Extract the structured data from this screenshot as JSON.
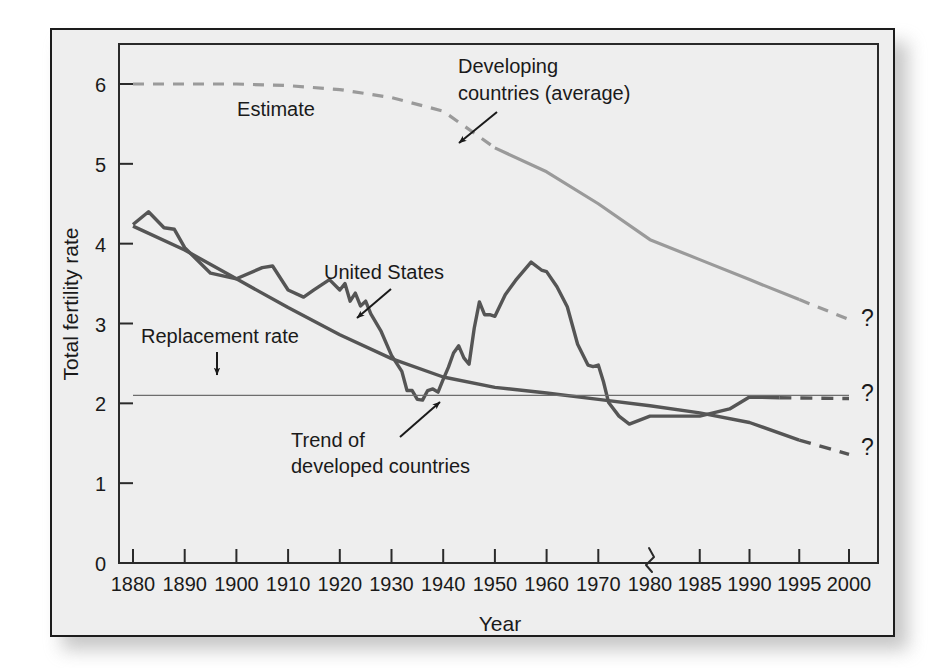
{
  "figure": {
    "background_color": "#eeeeee",
    "frame_color": "#1c1c1c",
    "page_color": "#ffffff"
  },
  "chart_data": {
    "type": "line",
    "title": "",
    "xlabel": "Year",
    "ylabel": "Total fertility rate",
    "ylim": [
      0,
      6.4
    ],
    "yticks": [
      0,
      1,
      2,
      3,
      4,
      5,
      6
    ],
    "ytick_labels": [
      "0",
      "1",
      "2",
      "3",
      "4",
      "5",
      "6"
    ],
    "xticks": [
      1880,
      1890,
      1900,
      1910,
      1920,
      1930,
      1940,
      1950,
      1960,
      1970,
      1980,
      1985,
      1990,
      1995,
      2000
    ],
    "xtick_labels": [
      "1880",
      "1890",
      "1900",
      "1910",
      "1920",
      "1930",
      "1940",
      "1950",
      "1960",
      "1970",
      "1980",
      "1985",
      "1990",
      "1995",
      "2000"
    ],
    "axis_break": {
      "at_year": 1980,
      "note": "x-axis scale changes from 10-year to 5-year spacing after 1980",
      "symbol": "zigzag"
    },
    "grid": false,
    "legend_position": "inline-annotations",
    "series": [
      {
        "name": "Developing countries (average)",
        "color": "#9a9a9a",
        "style_segments": [
          {
            "dash": "dashed",
            "from_year": 1880,
            "to_year": 1950,
            "label": "Estimate"
          },
          {
            "dash": "solid",
            "from_year": 1950,
            "to_year": 1995
          },
          {
            "dash": "dashed",
            "from_year": 1995,
            "to_year": 2000,
            "label": "projection"
          }
        ],
        "points": [
          {
            "x": 1880,
            "y": 6.0
          },
          {
            "x": 1890,
            "y": 6.0
          },
          {
            "x": 1900,
            "y": 6.0
          },
          {
            "x": 1910,
            "y": 5.98
          },
          {
            "x": 1920,
            "y": 5.93
          },
          {
            "x": 1930,
            "y": 5.83
          },
          {
            "x": 1940,
            "y": 5.66
          },
          {
            "x": 1950,
            "y": 5.2
          },
          {
            "x": 1960,
            "y": 4.9
          },
          {
            "x": 1970,
            "y": 4.5
          },
          {
            "x": 1980,
            "y": 4.05
          },
          {
            "x": 1985,
            "y": 3.8
          },
          {
            "x": 1990,
            "y": 3.55
          },
          {
            "x": 1995,
            "y": 3.3
          },
          {
            "x": 2000,
            "y": 3.05
          }
        ]
      },
      {
        "name": "United States",
        "color": "#555555",
        "style_segments": [
          {
            "dash": "solid",
            "from_year": 1880,
            "to_year": 1993
          },
          {
            "dash": "dashed",
            "from_year": 1993,
            "to_year": 2000
          }
        ],
        "points": [
          {
            "x": 1880,
            "y": 4.24
          },
          {
            "x": 1883,
            "y": 4.4
          },
          {
            "x": 1886,
            "y": 4.2
          },
          {
            "x": 1888,
            "y": 4.18
          },
          {
            "x": 1890,
            "y": 3.95
          },
          {
            "x": 1895,
            "y": 3.63
          },
          {
            "x": 1900,
            "y": 3.56
          },
          {
            "x": 1905,
            "y": 3.7
          },
          {
            "x": 1907,
            "y": 3.72
          },
          {
            "x": 1910,
            "y": 3.42
          },
          {
            "x": 1913,
            "y": 3.33
          },
          {
            "x": 1915,
            "y": 3.42
          },
          {
            "x": 1918,
            "y": 3.55
          },
          {
            "x": 1920,
            "y": 3.42
          },
          {
            "x": 1921,
            "y": 3.5
          },
          {
            "x": 1922,
            "y": 3.28
          },
          {
            "x": 1923,
            "y": 3.38
          },
          {
            "x": 1924,
            "y": 3.22
          },
          {
            "x": 1925,
            "y": 3.28
          },
          {
            "x": 1926,
            "y": 3.12
          },
          {
            "x": 1928,
            "y": 2.9
          },
          {
            "x": 1930,
            "y": 2.6
          },
          {
            "x": 1932,
            "y": 2.4
          },
          {
            "x": 1933,
            "y": 2.16
          },
          {
            "x": 1934,
            "y": 2.16
          },
          {
            "x": 1935,
            "y": 2.05
          },
          {
            "x": 1936,
            "y": 2.04
          },
          {
            "x": 1937,
            "y": 2.16
          },
          {
            "x": 1938,
            "y": 2.18
          },
          {
            "x": 1939,
            "y": 2.14
          },
          {
            "x": 1940,
            "y": 2.3
          },
          {
            "x": 1941,
            "y": 2.45
          },
          {
            "x": 1942,
            "y": 2.63
          },
          {
            "x": 1943,
            "y": 2.72
          },
          {
            "x": 1944,
            "y": 2.57
          },
          {
            "x": 1945,
            "y": 2.49
          },
          {
            "x": 1946,
            "y": 2.94
          },
          {
            "x": 1947,
            "y": 3.27
          },
          {
            "x": 1948,
            "y": 3.11
          },
          {
            "x": 1949,
            "y": 3.11
          },
          {
            "x": 1950,
            "y": 3.09
          },
          {
            "x": 1952,
            "y": 3.36
          },
          {
            "x": 1954,
            "y": 3.54
          },
          {
            "x": 1957,
            "y": 3.77
          },
          {
            "x": 1959,
            "y": 3.67
          },
          {
            "x": 1960,
            "y": 3.65
          },
          {
            "x": 1962,
            "y": 3.46
          },
          {
            "x": 1964,
            "y": 3.21
          },
          {
            "x": 1966,
            "y": 2.74
          },
          {
            "x": 1968,
            "y": 2.48
          },
          {
            "x": 1969,
            "y": 2.46
          },
          {
            "x": 1970,
            "y": 2.48
          },
          {
            "x": 1971,
            "y": 2.27
          },
          {
            "x": 1972,
            "y": 2.01
          },
          {
            "x": 1974,
            "y": 1.84
          },
          {
            "x": 1976,
            "y": 1.74
          },
          {
            "x": 1980,
            "y": 1.84
          },
          {
            "x": 1985,
            "y": 1.84
          },
          {
            "x": 1988,
            "y": 1.93
          },
          {
            "x": 1990,
            "y": 2.08
          },
          {
            "x": 1993,
            "y": 2.07
          },
          {
            "x": 2000,
            "y": 2.06
          }
        ]
      },
      {
        "name": "Trend of developed countries",
        "color": "#555555",
        "style_segments": [
          {
            "dash": "solid",
            "from_year": 1880,
            "to_year": 1995
          },
          {
            "dash": "dashed",
            "from_year": 1995,
            "to_year": 2000
          }
        ],
        "points": [
          {
            "x": 1880,
            "y": 4.22
          },
          {
            "x": 1890,
            "y": 3.92
          },
          {
            "x": 1900,
            "y": 3.56
          },
          {
            "x": 1910,
            "y": 3.2
          },
          {
            "x": 1920,
            "y": 2.86
          },
          {
            "x": 1930,
            "y": 2.56
          },
          {
            "x": 1940,
            "y": 2.33
          },
          {
            "x": 1950,
            "y": 2.2
          },
          {
            "x": 1960,
            "y": 2.13
          },
          {
            "x": 1970,
            "y": 2.05
          },
          {
            "x": 1980,
            "y": 1.97
          },
          {
            "x": 1985,
            "y": 1.88
          },
          {
            "x": 1990,
            "y": 1.76
          },
          {
            "x": 1995,
            "y": 1.54
          },
          {
            "x": 2000,
            "y": 1.36
          }
        ]
      },
      {
        "name": "Replacement rate",
        "color": "#6d6d6d",
        "style_segments": [
          {
            "dash": "solid",
            "from_year": 1880,
            "to_year": 2000
          }
        ],
        "constant_value": 2.1,
        "points": [
          {
            "x": 1880,
            "y": 2.1
          },
          {
            "x": 2000,
            "y": 2.1
          }
        ]
      }
    ],
    "annotations": [
      {
        "id": "estimate",
        "text": "Estimate",
        "x_px": 276,
        "y_px": 116,
        "arrow": false
      },
      {
        "id": "developing-countries",
        "text_line_1": "Developing",
        "text_line_2": "countries (average)",
        "x_px": 458,
        "y_px": 73,
        "arrow": true
      },
      {
        "id": "united-states",
        "text": "United States",
        "x_px": 324,
        "y_px": 279,
        "arrow": true
      },
      {
        "id": "replacement-rate",
        "text": "Replacement rate",
        "x_px": 141,
        "y_px": 343,
        "arrow": true
      },
      {
        "id": "trend-developed",
        "text_line_1": "Trend of",
        "text_line_2": "developed countries",
        "x_px": 291,
        "y_px": 447,
        "arrow": true
      }
    ],
    "question_marks": [
      {
        "id": "qmark-developing",
        "text": "?",
        "x_px": 861,
        "y_px": 326
      },
      {
        "id": "qmark-us",
        "text": "?",
        "x_px": 861,
        "y_px": 401
      },
      {
        "id": "qmark-developed",
        "text": "?",
        "x_px": 861,
        "y_px": 455
      }
    ]
  }
}
